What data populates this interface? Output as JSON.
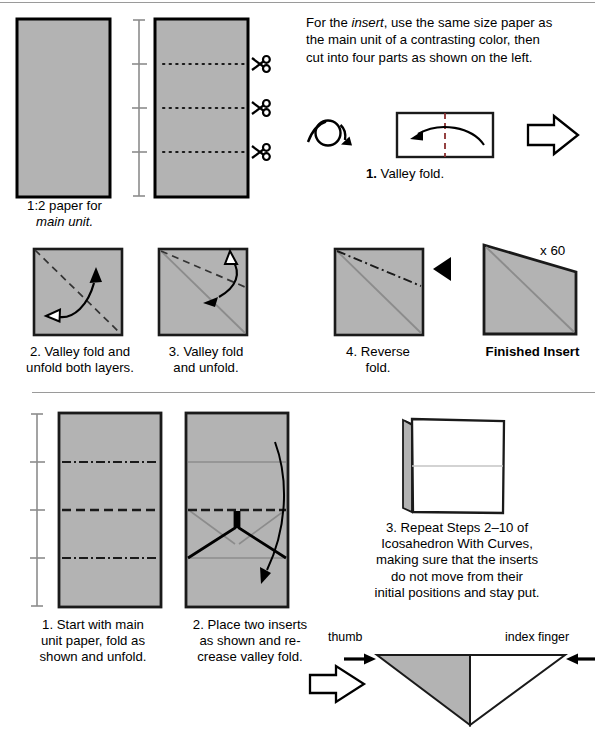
{
  "meta": {
    "sheet_title": "Origami insert and main unit folding instructions",
    "paper_fill": "#b3b3b3",
    "paper_stroke": "#000000",
    "crease_gray": "#8c8c8c",
    "rule_color": "#9a9a9a",
    "dash_color": "#1a1a1a"
  },
  "top_section": {
    "left_paper_caption_line1": "1:2 paper for",
    "left_paper_caption_line2": "main unit.",
    "intro_paragraph": "For the insert, use the same size paper as the main unit of a contrasting color, then cut into four parts as shown on the left.",
    "intro_line1_a": "For the ",
    "intro_line1_italic": "insert",
    "intro_line1_b": ", use the same size paper as",
    "intro_line2": "the main unit of a contrasting color, then",
    "intro_line3": "cut into four parts as shown on the left.",
    "scissors_icon_count": 3,
    "cut_lines_count": 3,
    "measure_ticks": 4,
    "step1": {
      "number": "1.",
      "label": "Valley fold.",
      "caption": "1. Valley fold.",
      "turnover_icon": "turn-over-icon",
      "next_arrow_icon": "hollow-right-arrow-icon"
    }
  },
  "insert_steps": [
    {
      "number": "2.",
      "caption_line1": "2. Valley fold and",
      "caption_line2": "unfold both layers.",
      "label": "Valley fold and unfold both layers."
    },
    {
      "number": "3.",
      "caption_line1": "3. Valley fold",
      "caption_line2": "and unfold.",
      "label": "Valley fold and unfold."
    },
    {
      "number": "4.",
      "caption_line1": "4. Reverse",
      "caption_line2": "fold.",
      "label": "Reverse fold."
    }
  ],
  "finished_insert": {
    "caption": "Finished Insert",
    "quantity": "x 60"
  },
  "bottom_section": {
    "step1": {
      "caption_line1": "1. Start with main",
      "caption_line2": "unit paper, fold as",
      "caption_line3": "shown and unfold.",
      "label": "Start with main unit paper, fold as shown and unfold."
    },
    "step2": {
      "caption_line1": "2. Place two inserts",
      "caption_line2": "as shown and re-",
      "caption_line3": "crease valley fold.",
      "label": "Place two inserts as shown and re-crease valley fold."
    },
    "step3": {
      "caption_line1": "3. Repeat Steps 2–10 of",
      "caption_line2": "Icosahedron With Curves,",
      "caption_line3": "making sure that the inserts",
      "caption_line4": "do not move from their",
      "caption_line5": "initial positions and stay put.",
      "label": "Repeat Steps 2–10 of Icosahedron With Curves, making sure that the inserts do not move from their initial positions and stay put."
    },
    "hand_labels": {
      "thumb": "thumb",
      "index_finger": "index finger"
    },
    "next_arrow_icon": "hollow-right-arrow-icon"
  }
}
